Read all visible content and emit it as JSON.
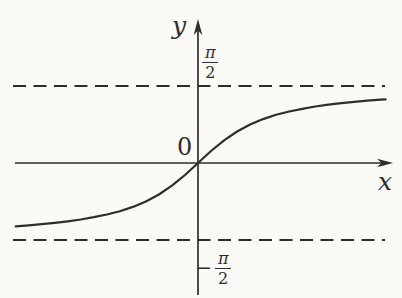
{
  "figure": {
    "labels": {
      "y_axis": "y",
      "x_axis": "x",
      "origin": "0",
      "pi": "π",
      "two": "2",
      "minus": "−"
    },
    "ink_color": "#2d2d2d",
    "background_color": "#fbfaf7"
  },
  "chart_data": {
    "type": "line",
    "xlabel": "x",
    "ylabel": "y",
    "origin_label": "0",
    "grid": false,
    "xlim": [
      -3.6,
      3.8
    ],
    "ylim": [
      -1.8,
      1.8
    ],
    "asymptotes": [
      {
        "y": 1.5708,
        "label": "π/2",
        "style": "dashed"
      },
      {
        "y": -1.5708,
        "label": "−π/2",
        "style": "dashed"
      }
    ],
    "x": [
      -3.5,
      -3.25,
      -3.0,
      -2.75,
      -2.5,
      -2.25,
      -2.0,
      -1.75,
      -1.5,
      -1.25,
      -1.0,
      -0.75,
      -0.5,
      -0.25,
      0,
      0.25,
      0.5,
      0.75,
      1.0,
      1.25,
      1.5,
      1.75,
      2.0,
      2.25,
      2.5,
      2.75,
      3.0,
      3.25,
      3.5,
      3.6
    ],
    "y": [
      -1.2925,
      -1.2723,
      -1.249,
      -1.222,
      -1.1903,
      -1.1526,
      -1.1071,
      -1.0517,
      -0.9828,
      -0.8961,
      -0.7854,
      -0.6435,
      -0.4636,
      -0.245,
      0,
      0.245,
      0.4636,
      0.6435,
      0.7854,
      0.8961,
      0.9828,
      1.0517,
      1.1071,
      1.1526,
      1.1903,
      1.222,
      1.249,
      1.2723,
      1.2925,
      1.2998
    ],
    "pixel_map": {
      "origin_px": [
        198,
        163
      ],
      "px_per_unit_x": 52.1,
      "px_per_unit_y": 49.0
    }
  }
}
